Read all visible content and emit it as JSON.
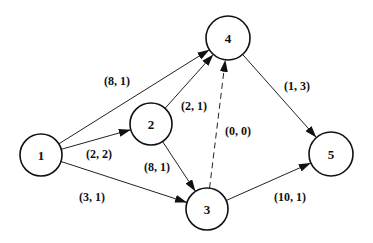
{
  "diagram": {
    "type": "directed-network",
    "nodes": [
      {
        "id": "1",
        "label": "1",
        "x": 41,
        "y": 155,
        "r": 21
      },
      {
        "id": "2",
        "label": "2",
        "x": 151,
        "y": 124,
        "r": 21
      },
      {
        "id": "3",
        "label": "3",
        "x": 207,
        "y": 209,
        "r": 21
      },
      {
        "id": "4",
        "label": "4",
        "x": 228,
        "y": 38,
        "r": 22
      },
      {
        "id": "5",
        "label": "5",
        "x": 331,
        "y": 154,
        "r": 22
      }
    ],
    "edges": [
      {
        "from": "1",
        "to": "4",
        "label": "(8, 1)",
        "lx": 117,
        "ly": 81,
        "dashed": false
      },
      {
        "from": "1",
        "to": "2",
        "label": "(2, 2)",
        "lx": 99,
        "ly": 154,
        "dashed": false
      },
      {
        "from": "1",
        "to": "3",
        "label": "(3, 1)",
        "lx": 92,
        "ly": 197,
        "dashed": false
      },
      {
        "from": "2",
        "to": "4",
        "label": "(2, 1)",
        "lx": 194,
        "ly": 106,
        "dashed": false
      },
      {
        "from": "2",
        "to": "3",
        "label": "(8, 1)",
        "lx": 157,
        "ly": 167,
        "dashed": false
      },
      {
        "from": "3",
        "to": "4",
        "label": "(0, 0)",
        "lx": 238,
        "ly": 131,
        "dashed": true
      },
      {
        "from": "4",
        "to": "5",
        "label": "(1, 3)",
        "lx": 297,
        "ly": 86,
        "dashed": false
      },
      {
        "from": "3",
        "to": "5",
        "label": "(10, 1)",
        "lx": 290,
        "ly": 197,
        "dashed": false
      }
    ]
  }
}
